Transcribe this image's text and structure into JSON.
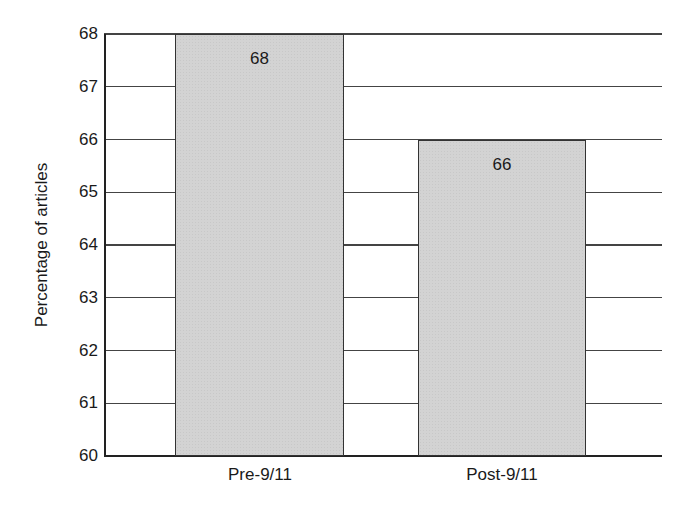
{
  "chart_data": {
    "type": "bar",
    "title": "",
    "xlabel": "",
    "ylabel": "Percentage of articles",
    "categories": [
      "Pre-9/11",
      "Post-9/11"
    ],
    "values": [
      68,
      66
    ],
    "data_labels": [
      "68",
      "66"
    ],
    "ylim": [
      60,
      68
    ],
    "yticks": [
      "60",
      "61",
      "62",
      "63",
      "64",
      "65",
      "66",
      "67",
      "68"
    ],
    "grid": true,
    "legend": null,
    "bar_color": "#d3d3d3",
    "edge_color": "#333333"
  }
}
